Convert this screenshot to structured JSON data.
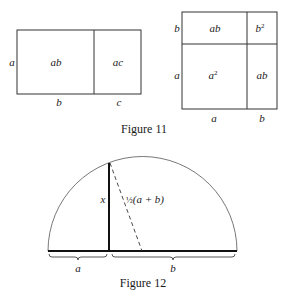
{
  "figure11": {
    "caption": "Figure 11",
    "left_diagram": {
      "cells": [
        {
          "label": "ab"
        },
        {
          "label": "ac"
        }
      ],
      "side_label": "a",
      "bottom_labels": [
        "b",
        "c"
      ]
    },
    "right_diagram": {
      "cells": [
        {
          "label": "ab"
        },
        {
          "label": "b",
          "sup": "2"
        },
        {
          "label": "a",
          "sup": "2"
        },
        {
          "label": "ab"
        }
      ],
      "side_labels": [
        "b",
        "a"
      ],
      "bottom_labels": [
        "a",
        "b"
      ]
    }
  },
  "figure12": {
    "caption": "Figure 12",
    "height_label": "x",
    "radius_label_frac": "½",
    "radius_label_expr": "(a + b)",
    "segment_labels": [
      "a",
      "b"
    ]
  }
}
